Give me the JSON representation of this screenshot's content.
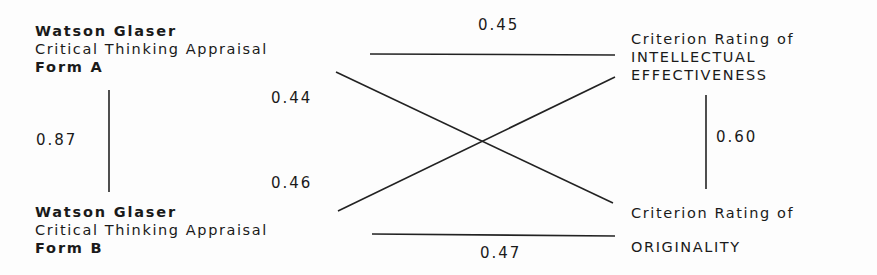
{
  "nodes": {
    "form_a": {
      "line1": "Watson Glaser",
      "line2": "Critical Thinking Appraisal",
      "line3": "Form A"
    },
    "form_b": {
      "line1": "Watson Glaser",
      "line2": "Critical Thinking Appraisal",
      "line3": "Form B"
    },
    "intellectual": {
      "line1": "Criterion Rating of",
      "line2": "INTELLECTUAL",
      "line3": "EFFECTIVENESS"
    },
    "originality": {
      "line1": "Criterion Rating of",
      "line2": "ORIGINALITY"
    }
  },
  "edges": {
    "formA_intellectual": "0.45",
    "formA_originality": "0.44",
    "formA_formB": "0.87",
    "formB_intellectual": "0.46",
    "formB_originality": "0.47",
    "intellectual_originality": "0.60"
  },
  "colors": {
    "ink": "#1a1a1a",
    "background": "#fdfdfd"
  }
}
